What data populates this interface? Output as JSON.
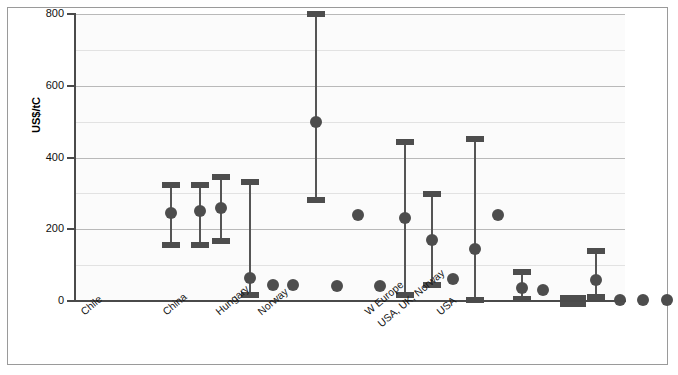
{
  "figure": {
    "background": "#ffffff",
    "frame_color": "#9a9a9a",
    "plot_background": "#fbfbfb"
  },
  "chart_data": {
    "type": "scatter",
    "subtype": "range-plot-with-central-estimate",
    "title": "",
    "subtitle": "",
    "xlabel": "",
    "ylabel": "US$/tC",
    "ylim": [
      0,
      800
    ],
    "yticks": [
      0,
      200,
      400,
      600,
      800
    ],
    "ytick_labels": [
      "0",
      "200",
      "400",
      "600",
      "800"
    ],
    "minor_gridline_step": 100,
    "grid": "horizontal",
    "legend": "none",
    "marker_color": "#4d4d4d",
    "categories": [
      "Chile",
      "China",
      "Hungary",
      "Norway",
      "W Europe",
      "USA, UK, Norway",
      "USA"
    ],
    "category_label_rotation_deg": -40,
    "points": [
      {
        "index": 1,
        "x_px": 96,
        "value": 245,
        "low": 155,
        "high": 322,
        "has_range": true
      },
      {
        "index": 2,
        "x_px": 125,
        "value": 250,
        "low": 155,
        "high": 323,
        "has_range": true
      },
      {
        "index": 3,
        "x_px": 146,
        "value": 260,
        "low": 168,
        "high": 345,
        "has_range": true
      },
      {
        "index": 4,
        "x_px": 175,
        "value": 65,
        "low": 18,
        "high": 332,
        "has_range": true
      },
      {
        "index": 5,
        "x_px": 198,
        "value": 45,
        "low": null,
        "high": null,
        "has_range": false
      },
      {
        "index": 6,
        "x_px": 218,
        "value": 45,
        "low": null,
        "high": null,
        "has_range": false
      },
      {
        "index": 7,
        "x_px": 241,
        "value": 500,
        "low": 282,
        "high": 800,
        "has_range": true
      },
      {
        "index": 8,
        "x_px": 262,
        "value": 42,
        "low": null,
        "high": null,
        "has_range": false
      },
      {
        "index": 9,
        "x_px": 283,
        "value": 240,
        "low": null,
        "high": null,
        "has_range": false
      },
      {
        "index": 10,
        "x_px": 305,
        "value": 42,
        "low": null,
        "high": null,
        "has_range": false
      },
      {
        "index": 11,
        "x_px": 330,
        "value": 230,
        "low": 18,
        "high": 443,
        "has_range": true
      },
      {
        "index": 12,
        "x_px": 357,
        "value": 170,
        "low": 45,
        "high": 298,
        "has_range": true
      },
      {
        "index": 13,
        "x_px": 378,
        "value": 60,
        "low": null,
        "high": null,
        "has_range": false
      },
      {
        "index": 14,
        "x_px": 400,
        "value": 145,
        "low": 3,
        "high": 452,
        "has_range": true
      },
      {
        "index": 15,
        "x_px": 423,
        "value": 240,
        "low": null,
        "high": null,
        "has_range": false
      },
      {
        "index": 16,
        "x_px": 447,
        "value": 35,
        "low": 5,
        "high": 82,
        "has_range": true
      },
      {
        "index": 17,
        "x_px": 468,
        "value": 30,
        "low": null,
        "high": null,
        "has_range": false
      },
      {
        "index": 18,
        "x_px": 498,
        "value": 3,
        "low": 0,
        "high": 8,
        "has_range": true
      },
      {
        "index": 19,
        "x_px": 521,
        "value": 58,
        "low": 12,
        "high": 140,
        "has_range": true
      },
      {
        "index": 20,
        "x_px": 545,
        "value": 2,
        "low": null,
        "high": null,
        "has_range": false
      },
      {
        "index": 21,
        "x_px": 568,
        "value": 2,
        "low": null,
        "high": null,
        "has_range": false
      },
      {
        "index": 22,
        "x_px": 592,
        "value": 2,
        "low": null,
        "high": null,
        "has_range": false
      },
      {
        "index": 23,
        "x_px": 615,
        "value": 2,
        "low": null,
        "high": null,
        "has_range": false
      }
    ],
    "category_label_anchors_px": [
      {
        "label": "Chile",
        "x": 78
      },
      {
        "label": "China",
        "x": 160
      },
      {
        "label": "Hungary",
        "x": 213
      },
      {
        "label": "Norway",
        "x": 255
      },
      {
        "label": "W Europe",
        "x": 362
      },
      {
        "label": "USA, UK, Norway",
        "x": 375
      },
      {
        "label": "USA",
        "x": 434
      }
    ]
  }
}
